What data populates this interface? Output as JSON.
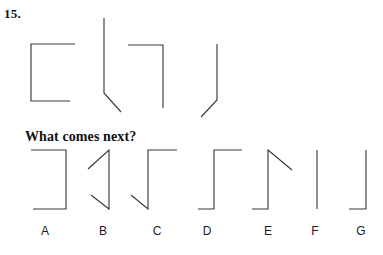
{
  "question": {
    "number": "15.",
    "prompt": "What comes next?"
  },
  "sequence": {
    "name": "pattern-sequence",
    "count": 4,
    "figures": [
      {
        "id": "seq-1",
        "description": "bracket opening right: top bar, left vertical, bottom bar",
        "path": "M 75 44 L 31 44 L 31 101 L 70 101"
      },
      {
        "id": "seq-2",
        "description": "long vertical line with diagonal foot to lower right",
        "path": "M 104 18 L 104 93 L 121 112"
      },
      {
        "id": "seq-3",
        "description": "top bar to the right then vertical down",
        "path": "M 128 45 L 163 45 L 163 108"
      },
      {
        "id": "seq-4",
        "description": "vertical line with diagonal foot to lower left",
        "path": "M 217 44 L 217 100 L 201 117"
      }
    ]
  },
  "options": {
    "name": "answer-options",
    "count": 7,
    "items": [
      {
        "label": "A",
        "label_x": 45,
        "description": "top bar, right vertical, bottom bar (reversed bracket)",
        "path": "M 31 7 L 66 7 L 66 66 L 33 66"
      },
      {
        "label": "B",
        "label_x": 103,
        "description": "diagonal up to top right, vertical down, diagonal out to lower left",
        "path": "M 88 26 L 109 7 L 109 66 L 91 52"
      },
      {
        "label": "C",
        "label_x": 157,
        "description": "top bar right, vertical down on left, diagonal to lower left",
        "path": "M 177 7 L 148 7 L 148 66 L 131 52"
      },
      {
        "label": "D",
        "label_x": 207,
        "description": "top bar right, vertical down, bottom bar left",
        "path": "M 242 7 L 214 7 L 214 66 L 198 66"
      },
      {
        "label": "E",
        "label_x": 268,
        "description": "diagonal down right from top, vertical down, bottom bar left",
        "path": "M 292 27 L 268 7 L 268 66 L 252 66"
      },
      {
        "label": "F",
        "label_x": 315,
        "description": "plain vertical line",
        "path": "M 317 7 L 317 66"
      },
      {
        "label": "G",
        "label_x": 361,
        "description": "vertical line with bottom bar to the left",
        "path": "M 366 7 L 366 66 L 349 66"
      }
    ]
  },
  "colors": {
    "stroke": "#3a3a3a",
    "text": "#111111",
    "label_text": "#1c1c1c",
    "background": "#ffffff"
  }
}
